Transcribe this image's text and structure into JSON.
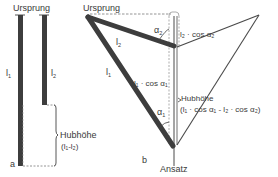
{
  "figure": {
    "panel_a": {
      "tag": "a",
      "origin_label": "Ursprung",
      "muscle1_label": "l",
      "muscle1_sub": "1",
      "muscle2_label": "l",
      "muscle2_sub": "2",
      "lift_label": "Hubhöhe",
      "lift_formula": "(l₁-l₂)"
    },
    "panel_b": {
      "tag": "b",
      "origin_label": "Ursprung",
      "insertion_label": "Ansatz",
      "l1_label": "l",
      "l1_sub": "1",
      "l2_label": "l",
      "l2_sub": "2",
      "alpha1_label": "α",
      "alpha1_sub": "1",
      "alpha2_label": "α",
      "alpha2_sub": "2",
      "l1_cos_label": "l₁ · cos α₁",
      "l2_cos_label": "l₂ · cos α₂",
      "lift_label": "Hubhöhe",
      "lift_formula": "(l₁ · cos α₁  -  l₂ · cos α₂)"
    },
    "colors": {
      "bar": "#3d3d3d",
      "line": "#4a4a4a",
      "dash": "#7a7a7a",
      "text": "#3a3a3a"
    }
  }
}
